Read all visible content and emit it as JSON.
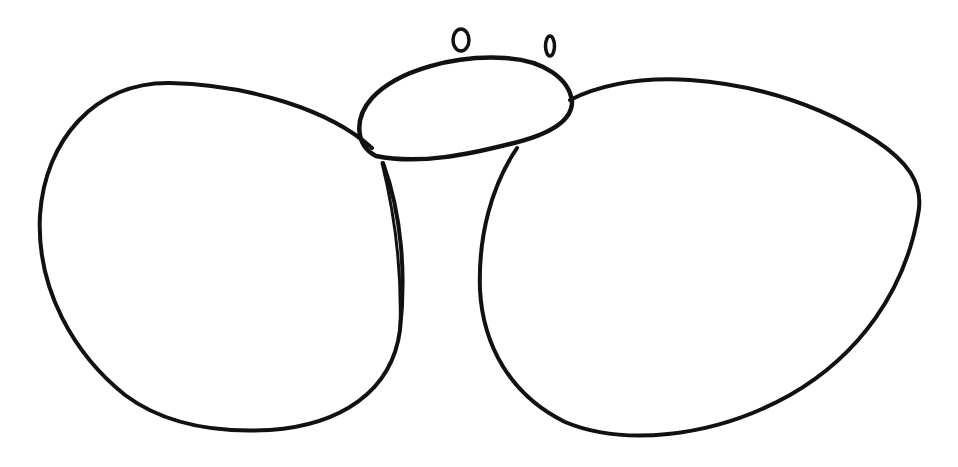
{
  "drawing": {
    "subject": "hand-drawn line sketch",
    "background": "#ffffff",
    "ink_color": "#111111",
    "shapes": [
      {
        "name": "left-wing"
      },
      {
        "name": "right-wing"
      },
      {
        "name": "head"
      },
      {
        "name": "left-eye"
      },
      {
        "name": "right-eye"
      }
    ]
  }
}
